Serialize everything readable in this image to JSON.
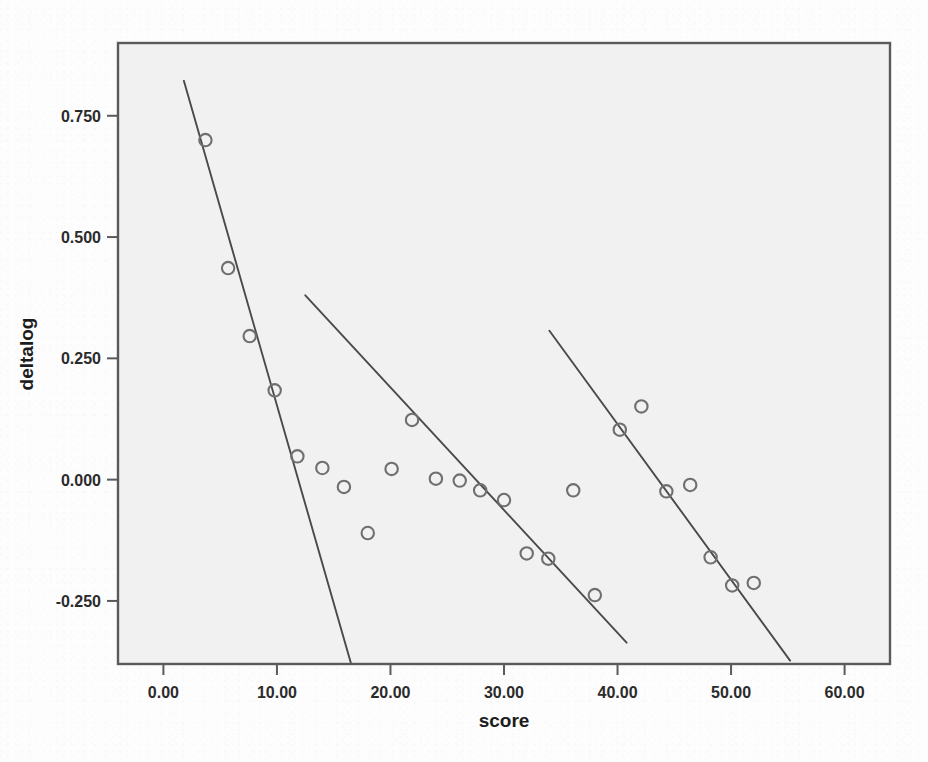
{
  "figure": {
    "background_color": "#fdfdfd",
    "plot_area_fill": "#f1f1f1",
    "frame_color": "#5a5a5a",
    "marker_color": "#6f6f6f",
    "line_color": "#4a4a4a",
    "text_color": "#1c1c1c"
  },
  "chart_data": {
    "type": "scatter",
    "title": "",
    "xlabel": "score",
    "ylabel": "deltalog",
    "xlim": [
      -4.0,
      64.0
    ],
    "ylim": [
      -0.38,
      0.9
    ],
    "xticks": [
      0,
      10,
      20,
      30,
      40,
      50,
      60
    ],
    "xtick_labels": [
      "0.00",
      "10.00",
      "20.00",
      "30.00",
      "40.00",
      "50.00",
      "60.00"
    ],
    "yticks": [
      0.75,
      0.5,
      0.25,
      0.0,
      -0.25
    ],
    "ytick_labels": [
      "0.750",
      "0.500",
      "0.250",
      "0.000",
      "-0.250"
    ],
    "grid": false,
    "legend": null,
    "marker_style": "open-circle",
    "series": [
      {
        "name": "group-1",
        "points": [
          {
            "x": 3.7,
            "y": 0.7
          },
          {
            "x": 5.7,
            "y": 0.436
          },
          {
            "x": 7.6,
            "y": 0.296
          },
          {
            "x": 9.8,
            "y": 0.184
          },
          {
            "x": 11.8,
            "y": 0.048
          }
        ]
      },
      {
        "name": "group-2",
        "points": [
          {
            "x": 14.0,
            "y": 0.024
          },
          {
            "x": 15.9,
            "y": -0.015
          },
          {
            "x": 18.0,
            "y": -0.11
          },
          {
            "x": 20.1,
            "y": 0.022
          },
          {
            "x": 21.9,
            "y": 0.123
          },
          {
            "x": 24.0,
            "y": 0.002
          },
          {
            "x": 26.1,
            "y": -0.002
          },
          {
            "x": 27.9,
            "y": -0.022
          },
          {
            "x": 30.0,
            "y": -0.042
          },
          {
            "x": 32.0,
            "y": -0.152
          },
          {
            "x": 33.9,
            "y": -0.163
          },
          {
            "x": 38.0,
            "y": -0.238
          }
        ]
      },
      {
        "name": "group-3",
        "points": [
          {
            "x": 36.1,
            "y": -0.022
          },
          {
            "x": 40.2,
            "y": 0.103
          },
          {
            "x": 42.1,
            "y": 0.151
          },
          {
            "x": 44.3,
            "y": -0.024
          },
          {
            "x": 46.4,
            "y": -0.011
          },
          {
            "x": 48.2,
            "y": -0.16
          },
          {
            "x": 50.1,
            "y": -0.218
          },
          {
            "x": 52.0,
            "y": -0.213
          }
        ]
      }
    ],
    "fit_lines": [
      {
        "name": "fit-line-1",
        "x1": 1.8,
        "y1": 0.822,
        "x2": 16.5,
        "y2": -0.377
      },
      {
        "name": "fit-line-2",
        "x1": 12.5,
        "y1": 0.38,
        "x2": 40.8,
        "y2": -0.336
      },
      {
        "name": "fit-line-3",
        "x1": 34.0,
        "y1": 0.307,
        "x2": 55.2,
        "y2": -0.373
      }
    ]
  }
}
